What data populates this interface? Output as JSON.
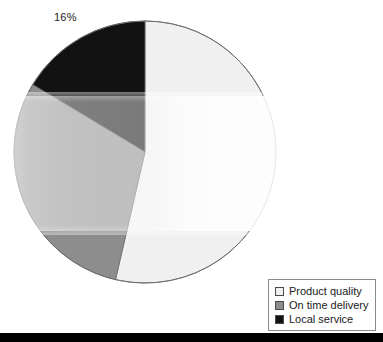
{
  "figure": {
    "background_color": "#ffffff",
    "bottom_rule_color": "#000000"
  },
  "callouts": [
    {
      "id": "local-service-pct",
      "text": "16%"
    }
  ],
  "legend": {
    "position": "bottom-right",
    "border_color": "#8a8a8a",
    "items": [
      {
        "label": "Product quality",
        "color": "#f0f0f0"
      },
      {
        "label": "On time delivery",
        "color": "#8d8d8d"
      },
      {
        "label": "Local service",
        "color": "#121212"
      }
    ]
  },
  "chart_data": {
    "type": "pie",
    "title": "",
    "subtitle": "",
    "xlabel": "",
    "ylabel": "",
    "grid": false,
    "legend_position": "bottom-right",
    "start_angle_deg": 90,
    "direction": "counterclockwise",
    "center": {
      "cx": 145,
      "cy": 152
    },
    "radius": 131,
    "categories": [
      "Product quality",
      "On time delivery",
      "Local service"
    ],
    "values": [
      54,
      30,
      16
    ],
    "value_unit": "percent",
    "colors": [
      "#f0f0f0",
      "#8d8d8d",
      "#121212"
    ],
    "labels_shown": [
      "",
      "",
      "16%"
    ],
    "slices": [
      {
        "name": "Product quality",
        "value": 54,
        "label": "",
        "color": "#f0f0f0",
        "start_angle_deg": 90,
        "end_angle_deg": -103
      },
      {
        "name": "On time delivery",
        "value": 30,
        "label": "",
        "color": "#8d8d8d",
        "start_angle_deg": 149,
        "end_angle_deg": 257
      },
      {
        "name": "Local service",
        "value": 16,
        "label": "16%",
        "color": "#121212",
        "start_angle_deg": 90,
        "end_angle_deg": 149
      }
    ]
  }
}
